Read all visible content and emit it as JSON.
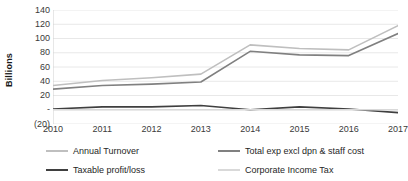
{
  "chart_data": {
    "type": "line",
    "title": "",
    "xlabel": "",
    "ylabel": "Billions",
    "categories": [
      "2010",
      "2011",
      "2012",
      "2013",
      "2014",
      "2015",
      "2016",
      "2017"
    ],
    "ylim": [
      -20,
      140
    ],
    "ytick_values": [
      140,
      120,
      100,
      80,
      60,
      40,
      20,
      0,
      -20
    ],
    "ytick_labels": [
      "140",
      "120",
      "100",
      "80",
      "60",
      "40",
      "20",
      "-",
      "(20)"
    ],
    "grid": true,
    "legend_position": "bottom",
    "series": [
      {
        "name": "Annual Turnover",
        "color": "#BFBFBF",
        "values": [
          34,
          41,
          45,
          50,
          91,
          86,
          84,
          118
        ]
      },
      {
        "name": "Total exp excl dpn & staff cost",
        "color": "#808080",
        "values": [
          29,
          34,
          36,
          39,
          82,
          77,
          76,
          107
        ]
      },
      {
        "name": "Taxable profit/loss",
        "color": "#3F3F3F",
        "values": [
          1,
          4,
          4,
          6,
          0,
          4,
          1,
          -4
        ]
      },
      {
        "name": "Corporate Income Tax",
        "color": "#D9D9D9",
        "values": [
          0,
          0,
          0,
          0,
          0,
          0,
          0,
          0
        ]
      }
    ]
  },
  "axis": {
    "y_title": "Billions",
    "y_labels": [
      "140",
      "120",
      "100",
      "80",
      "60",
      "40",
      "20",
      "-",
      "(20)"
    ],
    "x_labels": [
      "2010",
      "2011",
      "2012",
      "2013",
      "2014",
      "2015",
      "2016",
      "2017"
    ]
  },
  "legend": {
    "items": [
      {
        "label": "Annual Turnover",
        "color": "#BFBFBF"
      },
      {
        "label": "Total exp excl dpn & staff cost",
        "color": "#808080"
      },
      {
        "label": "Taxable profit/loss",
        "color": "#3F3F3F"
      },
      {
        "label": "Corporate Income Tax",
        "color": "#D9D9D9"
      }
    ]
  },
  "style": {
    "grid_color": "#E8E8E8",
    "axis_color": "#D0D0D0",
    "background": "#FFFFFF",
    "text_color": "#3A3A3A"
  }
}
